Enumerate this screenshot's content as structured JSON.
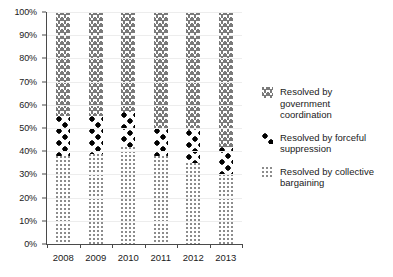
{
  "chart_data": {
    "type": "bar",
    "stacked": true,
    "normalized_percent": true,
    "title": "",
    "subtitle": "",
    "xlabel": "",
    "ylabel": "",
    "categories": [
      "2008",
      "2009",
      "2010",
      "2011",
      "2012",
      "2013"
    ],
    "ylim": [
      0,
      100
    ],
    "y_tick_labels": [
      "0%",
      "10%",
      "20%",
      "30%",
      "40%",
      "50%",
      "60%",
      "70%",
      "80%",
      "90%",
      "100%"
    ],
    "y_tick_values": [
      0,
      10,
      20,
      30,
      40,
      50,
      60,
      70,
      80,
      90,
      100
    ],
    "grid": true,
    "grid_axis": "y",
    "legend_position": "right",
    "series": [
      {
        "name": "Resolved by collective bargaining",
        "pattern": "fine-dots",
        "stack_order": 0,
        "values": [
          38,
          39,
          42,
          38,
          35,
          30
        ]
      },
      {
        "name": "Resolved by forceful suppression",
        "pattern": "dark-diamonds",
        "stack_order": 1,
        "values": [
          17,
          16,
          15,
          12,
          14,
          12
        ]
      },
      {
        "name": "Resolved by government coordination",
        "pattern": "zigzag-waves",
        "stack_order": 2,
        "values": [
          45,
          45,
          43,
          50,
          51,
          58
        ]
      }
    ],
    "segment_boundaries": {
      "2008": {
        "bargaining": [
          0,
          38
        ],
        "suppression": [
          38,
          55
        ],
        "government": [
          55,
          100
        ]
      },
      "2009": {
        "bargaining": [
          0,
          39
        ],
        "suppression": [
          39,
          55
        ],
        "government": [
          55,
          100
        ]
      },
      "2010": {
        "bargaining": [
          0,
          42
        ],
        "suppression": [
          42,
          57
        ],
        "government": [
          57,
          100
        ]
      },
      "2011": {
        "bargaining": [
          0,
          38
        ],
        "suppression": [
          38,
          50
        ],
        "government": [
          50,
          100
        ]
      },
      "2012": {
        "bargaining": [
          0,
          35
        ],
        "suppression": [
          35,
          49
        ],
        "government": [
          49,
          100
        ]
      },
      "2013": {
        "bargaining": [
          0,
          30
        ],
        "suppression": [
          30,
          42
        ],
        "government": [
          42,
          100
        ]
      }
    }
  },
  "legend": {
    "items": [
      {
        "label": "Resolved by\ngovernment\ncoordination",
        "pattern": "zigzag-waves"
      },
      {
        "label": "Resolved by forceful\nsuppression",
        "pattern": "dark-diamonds"
      },
      {
        "label": "Resolved by collective\nbargaining",
        "pattern": "fine-dots"
      }
    ]
  },
  "colors": {
    "axis": "#4a4a4a",
    "grid": "#ededed",
    "text": "#1a1a1a",
    "pattern_light": "#8c8c8c",
    "pattern_mid": "#7a7a7a",
    "pattern_dark": "#000000",
    "background": "#ffffff"
  }
}
